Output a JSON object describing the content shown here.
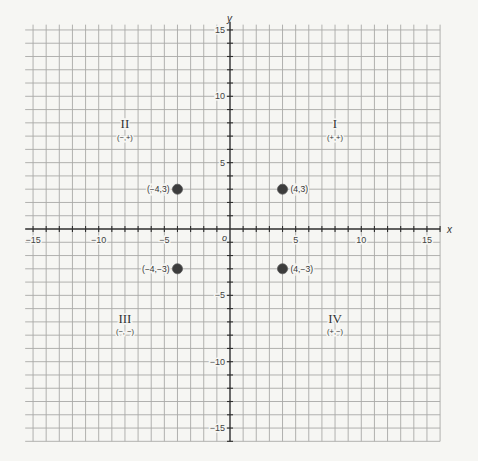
{
  "chart_data": {
    "type": "scatter",
    "title": "",
    "xlabel": "x",
    "ylabel": "y",
    "origin_label": "o",
    "xlim": [
      -15.6,
      16
    ],
    "ylim": [
      -16,
      15.4
    ],
    "grid": true,
    "grid_step": 1,
    "tick_step": 1,
    "x_tick_labels": [
      {
        "value": -15,
        "label": "−15"
      },
      {
        "value": -10,
        "label": "−10"
      },
      {
        "value": -5,
        "label": "−5"
      },
      {
        "value": 5,
        "label": "5"
      },
      {
        "value": 10,
        "label": "10"
      },
      {
        "value": 15,
        "label": "15"
      }
    ],
    "y_tick_labels": [
      {
        "value": 15,
        "label": "15"
      },
      {
        "value": 10,
        "label": "10"
      },
      {
        "value": 5,
        "label": "5"
      },
      {
        "value": -5,
        "label": "−5"
      },
      {
        "value": -10,
        "label": "−10"
      },
      {
        "value": -15,
        "label": "−15"
      }
    ],
    "points": [
      {
        "x": -4,
        "y": 3,
        "label": "(−4,3)"
      },
      {
        "x": 4,
        "y": 3,
        "label": "(4,3)"
      },
      {
        "x": -4,
        "y": -3,
        "label": "(−4,−3)"
      },
      {
        "x": 4,
        "y": -3,
        "label": "(4,−3)"
      }
    ],
    "quadrants": [
      {
        "id": "I",
        "numeral": "I",
        "signs": "(+,+)"
      },
      {
        "id": "II",
        "numeral": "II",
        "signs": "(−,+)"
      },
      {
        "id": "III",
        "numeral": "III",
        "signs": "(−, −)"
      },
      {
        "id": "IV",
        "numeral": "IV",
        "signs": "(+,−)"
      }
    ],
    "colors": {
      "grid": "#a9a9a7",
      "axis": "#2e2e2e",
      "point": "#3c3c3c",
      "background": "#f6f6f3"
    }
  }
}
